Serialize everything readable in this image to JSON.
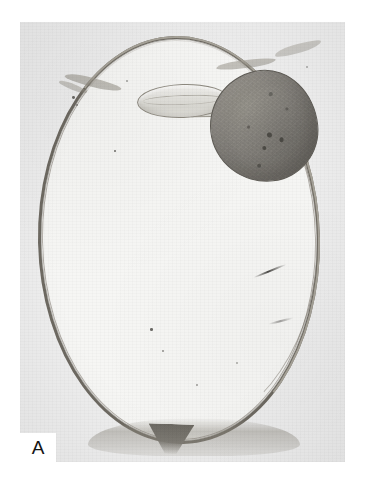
{
  "figure": {
    "panel_label": "A",
    "modality": "histopathology-photomicrograph",
    "background_color": "#ffffff",
    "plate_color": "#eeeeee"
  },
  "plate": {
    "name": "micrograph-plate",
    "x": 20,
    "y": 22,
    "width": 325,
    "height": 440
  },
  "structures": {
    "globe": {
      "label": "eye-globe",
      "wall_color": "#6e6a62",
      "interior_color": "#f7f7f6",
      "superior_wall_color": "#a8a49a"
    },
    "lens": {
      "label": "lens",
      "fill_color": "#e2e1dc",
      "outline_color": "#8e8a80"
    },
    "tumor": {
      "label": "intraocular-mass",
      "fill_color": "#8b8882",
      "outline_color": "#5e5b55",
      "foci_color": "#3f3d39",
      "foci_count": 7
    },
    "optic_nerve": {
      "label": "optic-nerve-head",
      "color": "#6d6a63"
    },
    "artifacts": {
      "label": "sectioning-artifacts",
      "streak_color": "#2d2b28",
      "speck_color": "#4a4844",
      "speck_count": 9,
      "flap_count": 4
    }
  }
}
